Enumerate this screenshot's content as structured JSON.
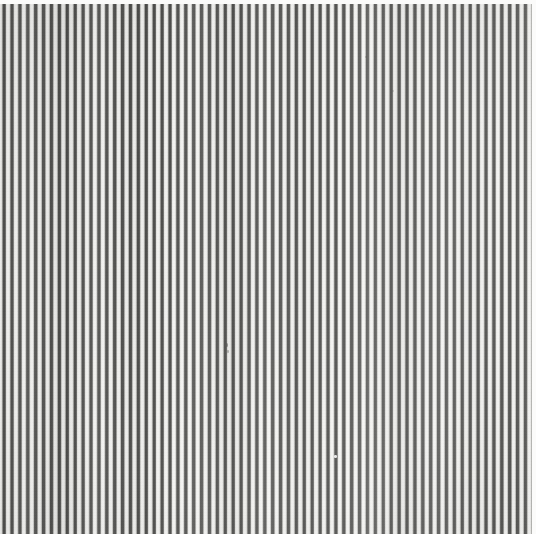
{
  "artwork": {
    "kind": "op-art-vertical-stripe-field",
    "medium_appearance": "painted or printed stripe panel, photographed",
    "canvas": {
      "width_px": 536,
      "height_px": 534,
      "aspect": "near-square"
    },
    "margins": {
      "top_px": 4,
      "right_px": 4,
      "bottom_px": 0,
      "left_px": 0,
      "margin_color": "#fbfbfa"
    },
    "pattern": {
      "orientation": "vertical",
      "period_px": 7.9,
      "dark_bar_width_px": 3.0,
      "light_gap_width_px": 4.9,
      "approx_dark_stripe_count": 68,
      "edge_softness": "soft / anti-aliased with grey transition bands",
      "regularity": "regular period with slight hand-made width and tone variation"
    },
    "colors": {
      "dark_stripe_core": "#4e4e4c",
      "dark_stripe_light": "#6e6e6c",
      "transition_grey": "#9c9c99",
      "light_stripe": "#f4f4f2",
      "light_stripe_shadowed": "#e6e6e3",
      "paper_ground": "#f1f1ef",
      "margin_white": "#fbfbfa",
      "speck_dark": "#5a5a58",
      "speck_light": "#ffffff"
    },
    "tonal_notes": {
      "left_region": "slightly denser and darker stripe weight",
      "center_region": "balanced mid contrast",
      "right_region": "slightly lighter, greyer stripe weight",
      "lower_right": "lightest area of the field"
    },
    "blemishes": [
      {
        "name": "speck-a",
        "x": 225,
        "y": 343,
        "tone": "dark"
      },
      {
        "name": "speck-b",
        "x": 227,
        "y": 350,
        "tone": "dark"
      },
      {
        "name": "speck-c",
        "x": 334,
        "y": 455,
        "tone": "light"
      },
      {
        "name": "speck-d",
        "x": 365,
        "y": 56,
        "tone": "dark"
      },
      {
        "name": "speck-e",
        "x": 392,
        "y": 90,
        "tone": "dark"
      },
      {
        "name": "speck-f",
        "x": 11,
        "y": 262,
        "tone": "dark"
      }
    ],
    "caption": ""
  }
}
